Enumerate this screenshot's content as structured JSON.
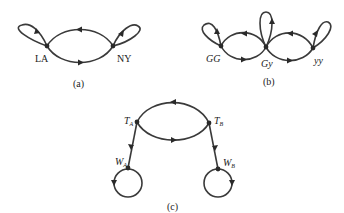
{
  "diagrams": [
    {
      "caption": "(a)",
      "nodes": [
        {
          "id": "LA",
          "label": "LA"
        },
        {
          "id": "NY",
          "label": "NY"
        }
      ],
      "edges": [
        {
          "from": "LA",
          "to": "LA",
          "kind": "self-loop"
        },
        {
          "from": "LA",
          "to": "NY",
          "kind": "arc-bottom"
        },
        {
          "from": "NY",
          "to": "LA",
          "kind": "arc-top"
        },
        {
          "from": "NY",
          "to": "NY",
          "kind": "self-loop"
        }
      ]
    },
    {
      "caption": "(b)",
      "nodes": [
        {
          "id": "GG",
          "label": "GG"
        },
        {
          "id": "Gy",
          "label": "Gy"
        },
        {
          "id": "yy",
          "label": "yy"
        }
      ],
      "edges": [
        {
          "from": "GG",
          "to": "GG",
          "kind": "self-loop"
        },
        {
          "from": "GG",
          "to": "Gy",
          "kind": "arc-bottom"
        },
        {
          "from": "Gy",
          "to": "GG",
          "kind": "arc-top"
        },
        {
          "from": "Gy",
          "to": "Gy",
          "kind": "self-loop"
        },
        {
          "from": "Gy",
          "to": "yy",
          "kind": "arc-bottom"
        },
        {
          "from": "yy",
          "to": "Gy",
          "kind": "arc-top"
        },
        {
          "from": "yy",
          "to": "yy",
          "kind": "self-loop"
        }
      ]
    },
    {
      "caption": "(c)",
      "nodes": [
        {
          "id": "TA",
          "label": "T",
          "sub": "A"
        },
        {
          "id": "TB",
          "label": "T",
          "sub": "B"
        },
        {
          "id": "WA",
          "label": "W",
          "sub": "A"
        },
        {
          "id": "WB",
          "label": "W",
          "sub": "B"
        }
      ],
      "edges": [
        {
          "from": "TA",
          "to": "TB",
          "kind": "arc-bottom"
        },
        {
          "from": "TB",
          "to": "TA",
          "kind": "arc-top"
        },
        {
          "from": "TA",
          "to": "WA",
          "kind": "straight"
        },
        {
          "from": "TB",
          "to": "WB",
          "kind": "straight"
        },
        {
          "from": "WA",
          "to": "WA",
          "kind": "self-loop"
        },
        {
          "from": "WB",
          "to": "WB",
          "kind": "self-loop"
        }
      ]
    }
  ]
}
